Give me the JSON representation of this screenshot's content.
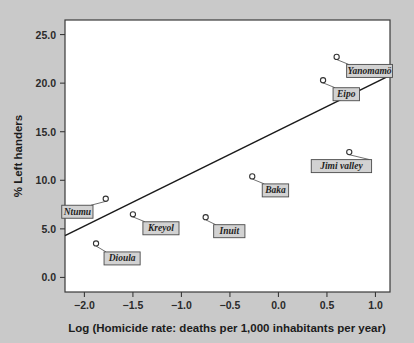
{
  "chart_data": {
    "type": "scatter",
    "title": "",
    "xlabel": "Log (Homicide rate: deaths per 1,000 inhabitants per year)",
    "ylabel": "% Left handers",
    "xlim": [
      -2.2,
      1.15
    ],
    "ylim": [
      -1.5,
      26.5
    ],
    "xticks": [
      -2.0,
      -1.5,
      -1.0,
      -0.5,
      0.0,
      0.5,
      1.0
    ],
    "xtick_labels": [
      "−2.0",
      "−1.5",
      "−1.0",
      "−0.5",
      "0.0",
      "0.5",
      "1.0"
    ],
    "yticks": [
      0.0,
      5.0,
      10.0,
      15.0,
      20.0,
      25.0
    ],
    "ytick_labels": [
      "0.0",
      "5.0",
      "10.0",
      "15.0",
      "20.0",
      "25.0"
    ],
    "grid": false,
    "legend": "none",
    "points": [
      {
        "label": "Yanomamö",
        "x": 0.6,
        "y": 22.7,
        "label_dx": 10,
        "label_dy": 14
      },
      {
        "label": "Eipo",
        "x": 0.46,
        "y": 20.3,
        "label_dx": 10,
        "label_dy": 14
      },
      {
        "label": "Jimi valley",
        "x": 0.73,
        "y": 12.9,
        "label_dx": -38,
        "label_dy": 14
      },
      {
        "label": "Baka",
        "x": -0.27,
        "y": 10.4,
        "label_dx": 10,
        "label_dy": 14
      },
      {
        "label": "Kreyol",
        "x": -1.5,
        "y": 6.5,
        "label_dx": 10,
        "label_dy": 14
      },
      {
        "label": "Inuit",
        "x": -0.75,
        "y": 6.2,
        "label_dx": 8,
        "label_dy": 14
      },
      {
        "label": "Ntumu",
        "x": -1.78,
        "y": 8.1,
        "label_dx": -44,
        "label_dy": 13
      },
      {
        "label": "Dioula",
        "x": -1.88,
        "y": 3.5,
        "label_dx": 8,
        "label_dy": 15
      }
    ],
    "trendline": {
      "x_start": -2.2,
      "y_start": 4.3,
      "x_end": 1.15,
      "y_end": 20.8
    },
    "colors": {
      "background": "#c9c9c9",
      "plot_area": "#ffffff",
      "axis": "#3a3a3a",
      "line": "#1a1a1a",
      "marker": "#333333",
      "label_box": "#d2d2d2",
      "text": "#1c1c1c"
    }
  }
}
